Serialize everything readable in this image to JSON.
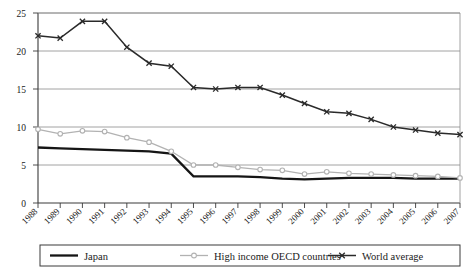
{
  "chart_data": {
    "type": "line",
    "title": "",
    "subtitle": "",
    "xlabel": "",
    "ylabel": "",
    "ylim": [
      0,
      25
    ],
    "y_ticks": [
      0,
      5,
      10,
      15,
      20,
      25
    ],
    "grid": true,
    "legend_position": "bottom",
    "categories": [
      "1988",
      "1989",
      "1990",
      "1991",
      "1992",
      "1993",
      "1994",
      "1995",
      "1996",
      "1997",
      "1998",
      "1999",
      "2000",
      "2001",
      "2002",
      "2003",
      "2004",
      "2005",
      "2006",
      "2007"
    ],
    "series": [
      {
        "name": "Japan",
        "color": "#151515",
        "marker": "none",
        "values": [
          7.3,
          7.2,
          7.1,
          7.0,
          6.9,
          6.8,
          6.5,
          3.5,
          3.5,
          3.5,
          3.4,
          3.2,
          3.1,
          3.2,
          3.3,
          3.3,
          3.3,
          3.2,
          3.2,
          3.2
        ]
      },
      {
        "name": "High income OECD countries",
        "color": "#b2b2b2",
        "marker": "circle",
        "values": [
          9.7,
          9.1,
          9.5,
          9.4,
          8.6,
          8.0,
          6.8,
          5.0,
          5.0,
          4.7,
          4.4,
          4.3,
          3.8,
          4.1,
          3.9,
          3.8,
          3.7,
          3.6,
          3.5,
          3.3
        ]
      },
      {
        "name": "World average",
        "color": "#2a2a2a",
        "marker": "x",
        "values": [
          22.0,
          21.7,
          23.9,
          23.9,
          20.5,
          18.4,
          18.0,
          15.2,
          15.0,
          15.2,
          15.2,
          14.2,
          13.1,
          12.0,
          11.8,
          11.0,
          10.0,
          9.6,
          9.2,
          9.0
        ]
      }
    ]
  },
  "legend": {
    "items": [
      {
        "label": "Japan"
      },
      {
        "label": "High income OECD countries"
      },
      {
        "label": "World average"
      }
    ]
  }
}
